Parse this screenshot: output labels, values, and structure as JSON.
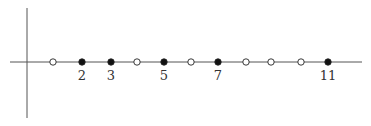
{
  "diagram": {
    "type": "number-line",
    "x_axis": {
      "x1": 10,
      "x2": 362,
      "y": 62,
      "color": "#555555"
    },
    "y_axis": {
      "x": 27,
      "y1": 8,
      "y2": 118,
      "color": "#555555"
    },
    "points": [
      {
        "n": 1,
        "x": 53,
        "filled": false,
        "label": ""
      },
      {
        "n": 2,
        "x": 82,
        "filled": true,
        "label": "2"
      },
      {
        "n": 3,
        "x": 111,
        "filled": true,
        "label": "3"
      },
      {
        "n": 4,
        "x": 137,
        "filled": false,
        "label": ""
      },
      {
        "n": 5,
        "x": 164,
        "filled": true,
        "label": "5"
      },
      {
        "n": 6,
        "x": 191,
        "filled": false,
        "label": ""
      },
      {
        "n": 7,
        "x": 218,
        "filled": true,
        "label": "7"
      },
      {
        "n": 8,
        "x": 246,
        "filled": false,
        "label": ""
      },
      {
        "n": 9,
        "x": 271,
        "filled": false,
        "label": ""
      },
      {
        "n": 10,
        "x": 301,
        "filled": false,
        "label": ""
      },
      {
        "n": 11,
        "x": 328,
        "filled": true,
        "label": "11"
      }
    ],
    "colors": {
      "filled": "#111111",
      "open_fill": "#ffffff",
      "stroke": "#222222",
      "label": "#333333"
    }
  }
}
